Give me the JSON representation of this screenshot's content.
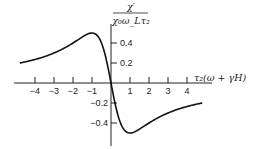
{
  "chart_data": {
    "type": "line",
    "title": "",
    "xlabel": "τ₂(ω + γH)",
    "ylabel": "χ′ / (χ₀ ω_L τ₂)",
    "ylabel_numerator": "χ′",
    "ylabel_denominator": "χ₀ω_Lτ₂",
    "xlabel_display": "τ₂(ω + γH)",
    "xlim": [
      -5.0,
      5.0
    ],
    "ylim": [
      -0.6,
      0.6
    ],
    "grid": false,
    "legend": null,
    "x_ticks": [
      -4,
      -3,
      -2,
      -1,
      1,
      2,
      3,
      4
    ],
    "x_tick_labels": [
      "−4",
      "−3",
      "−2",
      "−1",
      "1",
      "2",
      "3",
      "4"
    ],
    "y_ticks": [
      0.4,
      0.2,
      -0.2,
      -0.4
    ],
    "y_tick_labels": [
      "0.4",
      "0.2",
      "−0.2",
      "−0.4"
    ],
    "series": [
      {
        "name": "dispersion curve  -x/(1+x²)",
        "x": [
          -4.8,
          -4,
          -3,
          -2,
          -1.5,
          -1,
          -0.5,
          0,
          0.5,
          1,
          1.5,
          2,
          3,
          4,
          4.8
        ],
        "values": [
          0.2,
          0.235,
          0.3,
          0.4,
          0.46,
          0.5,
          0.4,
          0.0,
          -0.4,
          -0.5,
          -0.46,
          -0.4,
          -0.3,
          -0.235,
          -0.2
        ]
      }
    ]
  }
}
